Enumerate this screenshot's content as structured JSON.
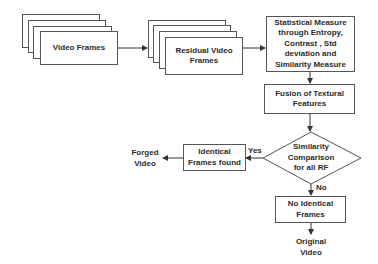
{
  "diagram": {
    "nodes": {
      "video_frames": "Video Frames",
      "residual_frames_line1": "Residual Video",
      "residual_frames_line2": "Frames",
      "statistical_line1": "Statistical Measure",
      "statistical_line2": "through Entropy,",
      "statistical_line3": "Contrast , Std",
      "statistical_line4": "deviation and",
      "statistical_line5": "Similarity Measure",
      "fusion_line1": "Fusion of Textural",
      "fusion_line2": "Features",
      "decision_line1": "Similarity",
      "decision_line2": "Comparison",
      "decision_line3": "for all RF",
      "identical_line1": "Identical",
      "identical_line2": "Frames found",
      "forged_line1": "Forged",
      "forged_line2": "Video",
      "no_identical_line1": "No Identical",
      "no_identical_line2": "Frames",
      "original_line1": "Original",
      "original_line2": "Video"
    },
    "edge_labels": {
      "yes": "Yes",
      "no": "No"
    }
  }
}
